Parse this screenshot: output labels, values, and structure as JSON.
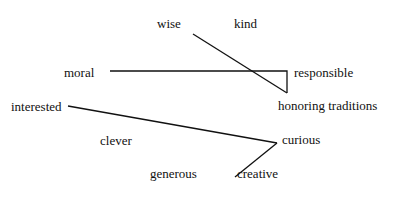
{
  "diagram": {
    "words": [
      {
        "id": "wise",
        "label": "wise",
        "x": 157,
        "y": 17
      },
      {
        "id": "kind",
        "label": "kind",
        "x": 234,
        "y": 17
      },
      {
        "id": "moral",
        "label": "moral",
        "x": 64,
        "y": 67
      },
      {
        "id": "responsible",
        "label": "responsible",
        "x": 294,
        "y": 67
      },
      {
        "id": "honoring-traditions",
        "label": "honoring traditions",
        "x": 278,
        "y": 100
      },
      {
        "id": "interested",
        "label": "interested",
        "x": 11,
        "y": 101
      },
      {
        "id": "clever",
        "label": "clever",
        "x": 100,
        "y": 135
      },
      {
        "id": "curious",
        "label": "curious",
        "x": 282,
        "y": 133
      },
      {
        "id": "generous",
        "label": "generous",
        "x": 150,
        "y": 168
      },
      {
        "id": "creative",
        "label": "creative",
        "x": 237,
        "y": 168
      }
    ],
    "links": [
      {
        "from": "wise",
        "to": "honoring-traditions",
        "points": "193,34 287,93"
      },
      {
        "from": "moral",
        "to": "honoring-traditions",
        "points": "110,71 287,71 287,93"
      },
      {
        "from": "interested",
        "to": "curious",
        "points": "68,106 277,143"
      },
      {
        "from": "curious",
        "to": "creative",
        "points": "277,143 235,177"
      }
    ]
  }
}
